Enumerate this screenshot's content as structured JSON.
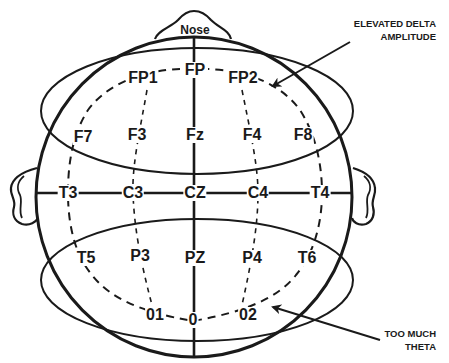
{
  "diagram": {
    "type": "eeg-10-20-electrode-map",
    "nose_label": "Nose",
    "electrodes": [
      {
        "id": "FP1",
        "label": "FP1",
        "x": 143,
        "y": 78
      },
      {
        "id": "FP",
        "label": "FP",
        "x": 195,
        "y": 70
      },
      {
        "id": "FP2",
        "label": "FP2",
        "x": 243,
        "y": 78
      },
      {
        "id": "F7",
        "label": "F7",
        "x": 83,
        "y": 137
      },
      {
        "id": "F3",
        "label": "F3",
        "x": 137,
        "y": 135
      },
      {
        "id": "Fz",
        "label": "Fz",
        "x": 195,
        "y": 135
      },
      {
        "id": "F4",
        "label": "F4",
        "x": 252,
        "y": 135
      },
      {
        "id": "F8",
        "label": "F8",
        "x": 303,
        "y": 135
      },
      {
        "id": "T3",
        "label": "T3",
        "x": 68,
        "y": 193
      },
      {
        "id": "C3",
        "label": "C3",
        "x": 133,
        "y": 193
      },
      {
        "id": "CZ",
        "label": "CZ",
        "x": 195,
        "y": 193
      },
      {
        "id": "C4",
        "label": "C4",
        "x": 258,
        "y": 193
      },
      {
        "id": "T4",
        "label": "T4",
        "x": 320,
        "y": 193
      },
      {
        "id": "T5",
        "label": "T5",
        "x": 86,
        "y": 258
      },
      {
        "id": "P3",
        "label": "P3",
        "x": 140,
        "y": 256
      },
      {
        "id": "PZ",
        "label": "PZ",
        "x": 195,
        "y": 258
      },
      {
        "id": "P4",
        "label": "P4",
        "x": 252,
        "y": 258
      },
      {
        "id": "T6",
        "label": "T6",
        "x": 307,
        "y": 258
      },
      {
        "id": "O1",
        "label": "01",
        "x": 155,
        "y": 315
      },
      {
        "id": "O",
        "label": "0",
        "x": 193,
        "y": 320
      },
      {
        "id": "O2",
        "label": "02",
        "x": 248,
        "y": 315
      }
    ],
    "annotations": [
      {
        "id": "delta",
        "lines": [
          "ELEVATED DELTA",
          "AMPLITUDE"
        ],
        "region": "frontal"
      },
      {
        "id": "theta",
        "lines": [
          "TOO MUCH",
          "THETA"
        ],
        "region": "occipital"
      }
    ],
    "colors": {
      "stroke": "#1a1a1a",
      "background": "#ffffff"
    }
  }
}
